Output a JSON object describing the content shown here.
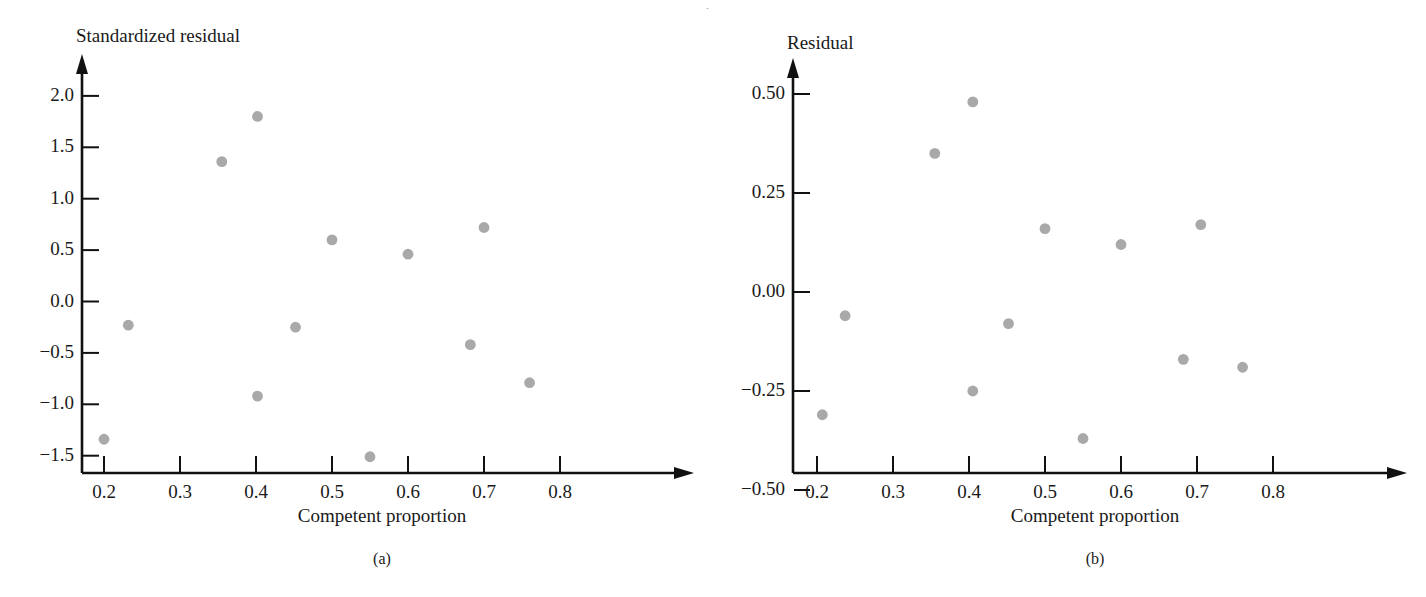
{
  "figure": {
    "background": "#ffffff",
    "dot_color": "#a9a9a9",
    "axis_color": "#111111",
    "text_color": "#1a1a1a",
    "top_partial_text": "."
  },
  "chart_data": [
    {
      "type": "scatter",
      "panel": "a",
      "caption": "(a)",
      "title": "",
      "ylabel": "Standardized residual",
      "xlabel": "Competent proportion",
      "xlim": [
        0.165,
        0.84
      ],
      "ylim": [
        -1.62,
        2.22
      ],
      "grid": false,
      "legend": "none",
      "xticks": [
        0.2,
        0.3,
        0.4,
        0.5,
        0.6,
        0.7,
        0.8
      ],
      "xtick_labels": [
        "0.2",
        "0.3",
        "0.4",
        "0.5",
        "0.6",
        "0.7",
        "0.8"
      ],
      "yticks": [
        2.0,
        1.5,
        1.0,
        0.5,
        0.0,
        -0.5,
        -1.0,
        -1.5
      ],
      "ytick_labels": [
        "2.0",
        "1.5",
        "1.0",
        "0.5",
        "0.0",
        "−0.5",
        "−1.0",
        "−1.5"
      ],
      "x": [
        0.2,
        0.232,
        0.355,
        0.402,
        0.402,
        0.452,
        0.5,
        0.55,
        0.6,
        0.682,
        0.7,
        0.76,
        0.2
      ],
      "y": [
        -1.34,
        -0.23,
        1.36,
        1.8,
        -0.92,
        -0.25,
        0.6,
        -1.51,
        0.46,
        -0.42,
        0.72,
        -0.79,
        -1.34
      ],
      "points": [
        {
          "x": 0.2,
          "y": -1.34
        },
        {
          "x": 0.232,
          "y": -0.23
        },
        {
          "x": 0.355,
          "y": 1.36
        },
        {
          "x": 0.402,
          "y": 1.8
        },
        {
          "x": 0.402,
          "y": -0.92
        },
        {
          "x": 0.452,
          "y": -0.25
        },
        {
          "x": 0.5,
          "y": 0.6
        },
        {
          "x": 0.55,
          "y": -1.51
        },
        {
          "x": 0.6,
          "y": 0.46
        },
        {
          "x": 0.682,
          "y": -0.42
        },
        {
          "x": 0.7,
          "y": 0.72
        },
        {
          "x": 0.76,
          "y": -0.79
        }
      ]
    },
    {
      "type": "scatter",
      "panel": "b",
      "caption": "(b)",
      "title": "",
      "ylabel": "Residual",
      "xlabel": "Competent proportion",
      "xlim": [
        0.165,
        0.84
      ],
      "ylim": [
        -0.54,
        0.6
      ],
      "grid": false,
      "legend": "none",
      "xticks": [
        0.2,
        0.3,
        0.4,
        0.5,
        0.6,
        0.7,
        0.8
      ],
      "xtick_labels": [
        "0.2",
        "0.3",
        "0.4",
        "0.5",
        "0.6",
        "0.7",
        "0.8"
      ],
      "yticks": [
        0.5,
        0.25,
        0.0,
        -0.25,
        -0.5
      ],
      "ytick_labels": [
        "0.50",
        "0.25",
        "0.00",
        "−0.25",
        "−0.50"
      ],
      "x": [
        0.207,
        0.237,
        0.355,
        0.405,
        0.405,
        0.452,
        0.5,
        0.55,
        0.6,
        0.682,
        0.705,
        0.76
      ],
      "y": [
        -0.31,
        -0.06,
        0.35,
        0.48,
        -0.25,
        -0.08,
        0.16,
        -0.37,
        0.12,
        -0.17,
        0.17,
        -0.19
      ],
      "points": [
        {
          "x": 0.207,
          "y": -0.31
        },
        {
          "x": 0.237,
          "y": -0.06
        },
        {
          "x": 0.355,
          "y": 0.35
        },
        {
          "x": 0.405,
          "y": 0.48
        },
        {
          "x": 0.405,
          "y": -0.25
        },
        {
          "x": 0.452,
          "y": -0.08
        },
        {
          "x": 0.5,
          "y": 0.16
        },
        {
          "x": 0.55,
          "y": -0.37
        },
        {
          "x": 0.6,
          "y": 0.12
        },
        {
          "x": 0.682,
          "y": -0.17
        },
        {
          "x": 0.705,
          "y": 0.17
        },
        {
          "x": 0.76,
          "y": -0.19
        }
      ]
    }
  ],
  "panel_a": {
    "ylabel": "Standardized residual",
    "xlabel": "Competent proportion",
    "caption": "(a)",
    "ytick_labels": [
      "2.0",
      "1.5",
      "1.0",
      "0.5",
      "0.0",
      "−0.5",
      "−1.0",
      "−1.5"
    ],
    "xtick_labels": [
      "0.2",
      "0.3",
      "0.4",
      "0.5",
      "0.6",
      "0.7",
      "0.8"
    ]
  },
  "panel_b": {
    "ylabel": "Residual",
    "xlabel": "Competent proportion",
    "caption": "(b)",
    "ytick_labels": [
      "0.50",
      "0.25",
      "0.00",
      "−0.25",
      "−0.50"
    ],
    "xtick_labels": [
      "0.2",
      "0.3",
      "0.4",
      "0.5",
      "0.6",
      "0.7",
      "0.8"
    ]
  }
}
